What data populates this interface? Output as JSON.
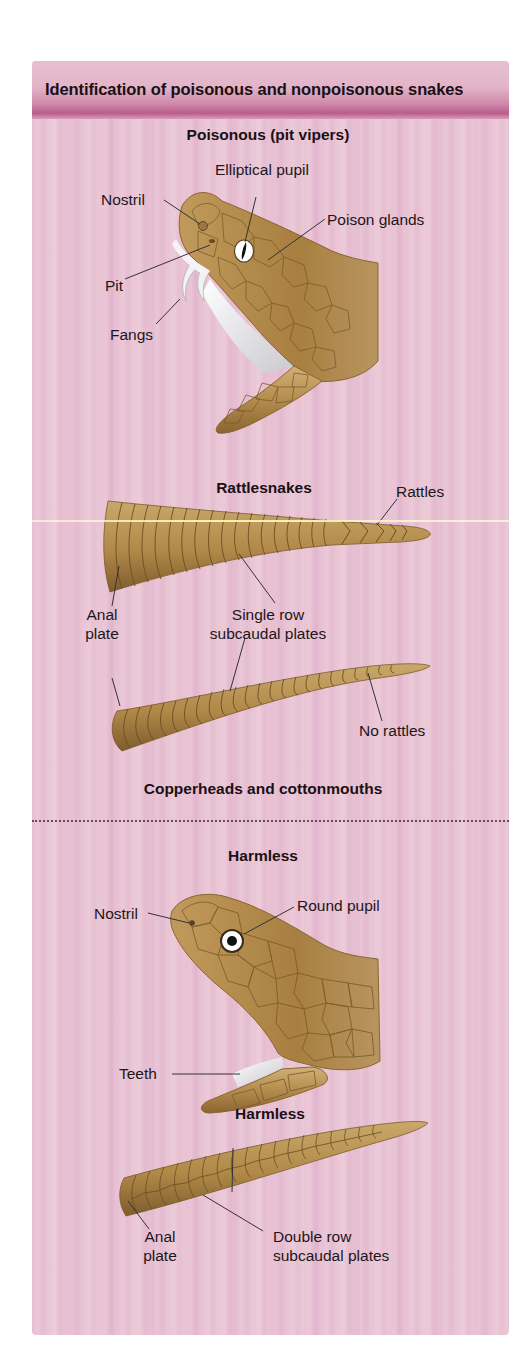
{
  "header": {
    "title": "Identification of poisonous and nonpoisonous snakes"
  },
  "sections": {
    "poisonous": {
      "title": "Poisonous (pit vipers)",
      "head_labels": {
        "nostril": "Nostril",
        "elliptical_pupil": "Elliptical pupil",
        "poison_glands": "Poison glands",
        "pit": "Pit",
        "fangs": "Fangs"
      }
    },
    "rattlesnakes": {
      "title": "Rattlesnakes",
      "labels": {
        "rattles": "Rattles",
        "anal_plate_line1": "Anal",
        "anal_plate_line2": "plate",
        "single_row_line1": "Single row",
        "single_row_line2": "subcaudal plates",
        "no_rattles": "No rattles"
      }
    },
    "copperheads": {
      "title": "Copperheads and cottonmouths"
    },
    "harmless_head": {
      "title": "Harmless",
      "labels": {
        "nostril": "Nostril",
        "round_pupil": "Round pupil",
        "teeth": "Teeth"
      }
    },
    "harmless_tail": {
      "title": "Harmless",
      "labels": {
        "anal_plate_line1": "Anal",
        "anal_plate_line2": "plate",
        "double_row_line1": "Double row",
        "double_row_line2": "subcaudal plates"
      }
    }
  },
  "colors": {
    "panel_background": "#e6bfd2",
    "header_band": "#b95c8c",
    "snake_body": "#b48c4e",
    "scale_lines": "#7a5a2c",
    "text": "#1a1015"
  }
}
